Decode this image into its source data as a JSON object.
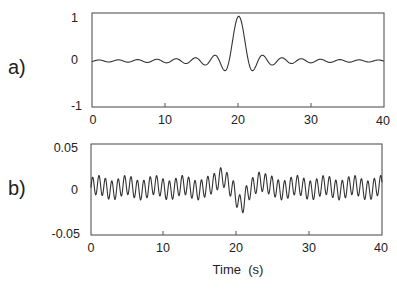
{
  "chart_data": [
    {
      "type": "line",
      "panel_label": "a)",
      "title": "",
      "xlabel": "",
      "ylabel": "",
      "xlim": [
        0,
        40
      ],
      "ylim": [
        -1,
        1
      ],
      "x_ticks": [
        "0",
        "10",
        "20",
        "30",
        "40"
      ],
      "y_ticks": [
        "1",
        "0",
        "-1"
      ],
      "grid": false,
      "description": "Sinc-like pulse centered at t=20 s with peak ~0.95 and decaying sidelobes (~4.1 s period)",
      "series": [
        {
          "name": "a",
          "x": [
            0,
            1,
            2,
            3,
            4,
            5,
            6,
            7,
            8,
            9,
            10,
            11,
            12,
            13,
            14,
            15,
            16,
            17,
            18,
            19,
            20,
            21,
            22,
            23,
            24,
            25,
            26,
            27,
            28,
            29,
            30,
            31,
            32,
            33,
            34,
            35,
            36,
            37,
            38,
            39,
            40
          ],
          "values": [
            -0.02,
            -0.05,
            -0.01,
            0.04,
            0.02,
            -0.05,
            -0.05,
            0.03,
            0.05,
            -0.02,
            -0.08,
            -0.03,
            0.06,
            0.05,
            -0.07,
            -0.14,
            0.0,
            0.14,
            0.1,
            0.45,
            0.95,
            0.55,
            -0.05,
            -0.26,
            -0.12,
            0.13,
            0.07,
            -0.1,
            -0.05,
            0.07,
            0.03,
            -0.08,
            -0.03,
            0.04,
            0.01,
            -0.06,
            -0.03,
            0.03,
            0.0,
            -0.05,
            -0.03
          ]
        }
      ]
    },
    {
      "type": "line",
      "panel_label": "b)",
      "title": "",
      "xlabel": "Time  (s)",
      "ylabel": "",
      "xlim": [
        0,
        40
      ],
      "ylim": [
        -0.05,
        0.05
      ],
      "x_ticks": [
        "0",
        "10",
        "20",
        "30",
        "40"
      ],
      "y_ticks": [
        "0.05",
        "0",
        "-0.05"
      ],
      "grid": false,
      "description": "Fast oscillation (~0.9 s period, amplitude ~0.01) with a disturbance near t=17-22 s (peak ~+0.022 at t~18, trough ~-0.026 at t~20.5)",
      "series": [
        {
          "name": "b",
          "x": [
            0,
            2,
            4,
            6,
            8,
            10,
            12,
            14,
            16,
            17,
            18,
            19,
            20,
            20.5,
            21,
            22,
            23,
            24,
            26,
            28,
            30,
            32,
            34,
            36,
            38,
            40
          ],
          "values": [
            0.0,
            0.01,
            -0.008,
            0.01,
            -0.008,
            0.01,
            -0.008,
            0.012,
            -0.01,
            0.012,
            0.022,
            0.01,
            -0.015,
            -0.026,
            -0.012,
            0.012,
            0.018,
            0.012,
            -0.008,
            0.012,
            -0.008,
            0.012,
            -0.008,
            0.012,
            -0.008,
            0.008
          ]
        }
      ]
    }
  ],
  "panels": {
    "a": {
      "label": "a)",
      "y_ticks": [
        "1",
        "0",
        "-1"
      ],
      "x_ticks": [
        "0",
        "10",
        "20",
        "30",
        "40"
      ]
    },
    "b": {
      "label": "b)",
      "y_ticks": [
        "0.05",
        "0",
        "-0.05"
      ],
      "x_ticks": [
        "0",
        "10",
        "20",
        "30",
        "40"
      ]
    }
  },
  "x_axis_title": "Time  (s)",
  "colors": {
    "trace": "#333333",
    "frame": "#555555",
    "text": "#222222",
    "background": "#ffffff"
  }
}
